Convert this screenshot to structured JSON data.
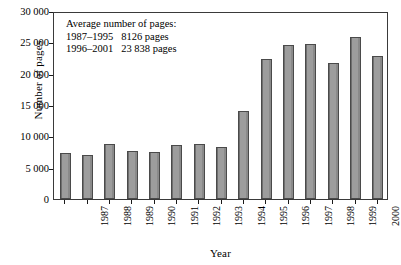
{
  "chart_data": {
    "type": "bar",
    "title": "",
    "xlabel": "Year",
    "ylabel": "Number of pages",
    "categories": [
      "1987",
      "1988",
      "1989",
      "1990",
      "1991",
      "1992",
      "1993",
      "1994",
      "1995",
      "1996",
      "1997",
      "1998",
      "1999",
      "2000",
      "2001"
    ],
    "values": [
      7300,
      7050,
      8800,
      7700,
      7500,
      8600,
      8700,
      8250,
      14000,
      22300,
      24600,
      24800,
      21700,
      25800,
      22800
    ],
    "ylim": [
      0,
      30000
    ],
    "ytick_values": [
      0,
      5000,
      10000,
      15000,
      20000,
      25000,
      30000
    ],
    "ytick_labels": [
      "0",
      "5 000",
      "10 000",
      "15 000",
      "20 000",
      "25 000",
      "30 000"
    ],
    "grid": false,
    "legend": "none",
    "bar_color": "#969696",
    "bar_edge_color": "#4a4a4a",
    "annotations": [
      "Average number of pages:",
      "1987–1995   8126 pages",
      "1996–2001   23 838 pages"
    ]
  }
}
